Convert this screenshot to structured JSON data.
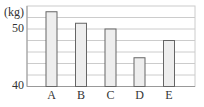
{
  "chart_data": {
    "type": "bar",
    "title": "",
    "xlabel": "",
    "ylabel": "(kg)",
    "categories": [
      "A",
      "B",
      "C",
      "D",
      "E"
    ],
    "values": [
      53,
      51,
      50,
      45,
      48
    ],
    "ylim": [
      40,
      54
    ],
    "yticks": [
      40,
      50
    ],
    "ytick_labels": [
      "40",
      "50"
    ],
    "grid": true,
    "grid_step": 2,
    "legend": null,
    "bar_fill": "#eeeeee",
    "bar_stroke": "#666666",
    "grid_color": "#cccccc"
  }
}
